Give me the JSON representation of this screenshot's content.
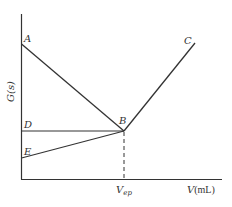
{
  "diagram": {
    "y_axis_label": "G(s)",
    "x_axis_label": "V(mL)",
    "x_axis_label_italic": "V",
    "x_axis_label_unit": "(mL)",
    "endpoint_label": "V",
    "endpoint_subscript": "ep",
    "points": {
      "A": "A",
      "B": "B",
      "C": "C",
      "D": "D",
      "E": "E"
    },
    "colors": {
      "line": "#333333",
      "background": "#ffffff"
    }
  }
}
